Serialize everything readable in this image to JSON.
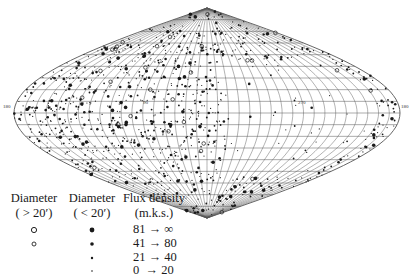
{
  "map": {
    "projection": "sinusoidal",
    "grid_step_deg": 10,
    "labels": {
      "left_edge": "180",
      "right_edge": "180",
      "center_left": "90",
      "center_right": "270"
    },
    "colors": {
      "grid": "#555555",
      "sources": "#1a1a1a",
      "background": "#ffffff"
    }
  },
  "legend": {
    "col1": {
      "title": "Diameter",
      "subtitle": "( > 20′)"
    },
    "col2": {
      "title": "Diameter",
      "subtitle": "( < 20′)"
    },
    "col3": {
      "title": "Flux density",
      "subtitle": "(m.k.s.)"
    },
    "rows": [
      {
        "range": "81 → ∞",
        "large_symbol": "open-circle-large",
        "small_symbol": "filled-dot-large"
      },
      {
        "range": "41 → 80",
        "large_symbol": "open-circle-small",
        "small_symbol": "filled-dot-medium"
      },
      {
        "range": "21 → 40",
        "large_symbol": "",
        "small_symbol": "filled-dot-small"
      },
      {
        "range": "0  → 20",
        "large_symbol": "",
        "small_symbol": "filled-dot-tiny"
      }
    ]
  }
}
